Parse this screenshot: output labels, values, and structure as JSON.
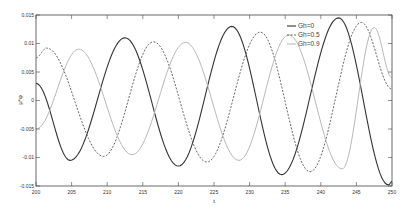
{
  "chart_data": {
    "type": "line",
    "title": "",
    "xlabel": "t",
    "ylabel": "μ*φ",
    "xlim": [
      200,
      250
    ],
    "ylim": [
      -0.015,
      0.015
    ],
    "grid": false,
    "legend_position": "upper-right-inside",
    "x_ticks": [
      200,
      205,
      210,
      215,
      220,
      225,
      230,
      235,
      240,
      245,
      250
    ],
    "x_tick_labels": [
      "200",
      "205",
      "210",
      "215",
      "220",
      "225",
      "230",
      "235",
      "240",
      "245",
      "250"
    ],
    "y_ticks": [
      -0.015,
      -0.01,
      -0.005,
      0,
      0.005,
      0.01,
      0.015
    ],
    "y_tick_labels": [
      "-0.015",
      "-0.01",
      "-0.005",
      "0",
      "0.005",
      "0.01",
      "0.015"
    ],
    "series": [
      {
        "name": "Gh=0",
        "color": "#333333",
        "style": "solid",
        "width": 1.1,
        "points": [
          [
            200,
            0.003
          ],
          [
            204.8,
            -0.0105
          ],
          [
            212.5,
            0.011
          ],
          [
            220,
            -0.0115
          ],
          [
            227.5,
            0.013
          ],
          [
            234.5,
            -0.013
          ],
          [
            242.5,
            0.0145
          ],
          [
            249.5,
            -0.0148
          ],
          [
            250,
            -0.0142
          ]
        ]
      },
      {
        "name": "Gh=0.5",
        "color": "#555555",
        "style": "dashed",
        "width": 0.9,
        "points": [
          [
            200,
            0.0075
          ],
          [
            201.5,
            0.0092
          ],
          [
            209.5,
            -0.0098
          ],
          [
            216.5,
            0.0103
          ],
          [
            224,
            -0.0108
          ],
          [
            231.5,
            0.012
          ],
          [
            238.5,
            -0.0125
          ],
          [
            245.7,
            0.0137
          ],
          [
            250,
            0.002
          ]
        ]
      },
      {
        "name": "Gh=0.9",
        "color": "#b8b8b8",
        "style": "solid",
        "width": 1.0,
        "points": [
          [
            200,
            -0.005
          ],
          [
            206,
            0.009
          ],
          [
            213.5,
            -0.0095
          ],
          [
            221,
            0.0102
          ],
          [
            228.5,
            -0.0105
          ],
          [
            235.5,
            0.0115
          ],
          [
            243,
            -0.012
          ],
          [
            247.5,
            0.0128
          ],
          [
            250,
            0.004
          ]
        ]
      }
    ]
  },
  "legend": {
    "items": [
      "Gh=0",
      "Gh=0.5",
      "Gh=0.9"
    ]
  }
}
